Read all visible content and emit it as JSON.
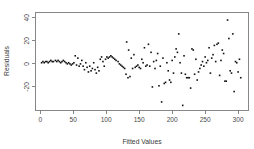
{
  "chart_data": {
    "type": "scatter",
    "title": "",
    "xlabel": "Fitted Values",
    "ylabel": "Residuals",
    "xlim": [
      -8,
      315
    ],
    "ylim": [
      -40,
      45
    ],
    "xticks": [
      0,
      50,
      100,
      150,
      200,
      250,
      300
    ],
    "xtick_labels": [
      "0",
      "50",
      "100",
      "150",
      "200",
      "250",
      "300"
    ],
    "yticks": [
      -20,
      0,
      20,
      40
    ],
    "ytick_labels": [
      "-20",
      "0",
      "20",
      "40"
    ],
    "grid": false,
    "legend": false,
    "marker": "filled-square",
    "marker_color": "#111111",
    "marker_size": 1.6,
    "frame": true,
    "x": [
      2,
      4,
      6,
      8,
      10,
      12,
      14,
      16,
      18,
      20,
      23,
      25,
      27,
      29,
      31,
      33,
      35,
      37,
      39,
      41,
      43,
      45,
      47,
      49,
      51,
      53,
      55,
      57,
      59,
      61,
      63,
      65,
      67,
      69,
      71,
      73,
      75,
      77,
      79,
      81,
      83,
      85,
      87,
      89,
      91,
      93,
      95,
      97,
      99,
      101,
      103,
      105,
      107,
      109,
      111,
      113,
      115,
      118,
      120,
      122,
      124,
      126,
      128,
      130,
      131,
      133,
      134,
      136,
      138,
      140,
      142,
      144,
      146,
      148,
      150,
      152,
      154,
      156,
      158,
      160,
      162,
      164,
      166,
      168,
      170,
      172,
      174,
      176,
      178,
      180,
      182,
      184,
      186,
      188,
      190,
      192,
      194,
      196,
      198,
      200,
      202,
      204,
      206,
      208,
      210,
      212,
      214,
      216,
      218,
      220,
      222,
      224,
      226,
      228,
      230,
      232,
      234,
      236,
      238,
      240,
      242,
      244,
      246,
      248,
      250,
      252,
      254,
      256,
      258,
      260,
      262,
      264,
      266,
      268,
      270,
      272,
      274,
      276,
      278,
      280,
      282,
      284,
      286,
      288,
      290,
      292,
      294,
      296,
      298,
      300,
      302,
      304
    ],
    "y": [
      1,
      2,
      1,
      2,
      2,
      1,
      2,
      3,
      2,
      2,
      3,
      2,
      3,
      2,
      1,
      2,
      3,
      2,
      1,
      0,
      1,
      0,
      -1,
      0,
      1,
      7,
      -1,
      5,
      -2,
      0,
      3,
      -2,
      -5,
      1,
      -3,
      -7,
      -2,
      -6,
      -4,
      1,
      -5,
      -8,
      -3,
      -6,
      4,
      6,
      2,
      -2,
      4,
      6,
      5,
      6,
      7,
      6,
      5,
      4,
      3,
      2,
      0,
      -1,
      -2,
      -3,
      -4,
      -9,
      19,
      -12,
      12,
      -11,
      5,
      -4,
      8,
      -3,
      -2,
      -1,
      -3,
      -4,
      4,
      1,
      14,
      -2,
      -1,
      17,
      -2,
      10,
      -20,
      2,
      -4,
      3,
      9,
      -19,
      -2,
      -33,
      5,
      -17,
      -16,
      1,
      -6,
      -14,
      -16,
      3,
      -8,
      6,
      13,
      10,
      26,
      1,
      -8,
      -36,
      7,
      -9,
      -12,
      -12,
      -12,
      -21,
      13,
      12,
      -9,
      4,
      -14,
      -7,
      -4,
      -1,
      2,
      -2,
      6,
      1,
      3,
      14,
      -8,
      5,
      8,
      16,
      2,
      17,
      18,
      -10,
      3,
      12,
      9,
      -15,
      -15,
      38,
      22,
      -6,
      -8,
      26,
      -24,
      2,
      1,
      -7,
      4,
      -12
    ]
  }
}
